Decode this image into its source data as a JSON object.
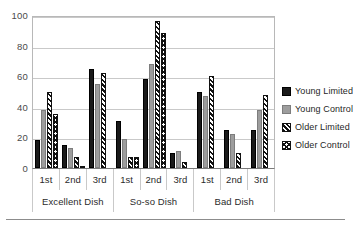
{
  "chart_data": {
    "type": "bar",
    "title": "",
    "subtitle": "",
    "xlabel": "",
    "ylabel": "",
    "ylim": [
      0,
      100
    ],
    "yticks": [
      0,
      20,
      40,
      60,
      80,
      100
    ],
    "grid": true,
    "legend_position": "right",
    "categories": [
      "1st",
      "2nd",
      "3rd",
      "1st",
      "2nd",
      "3rd",
      "1st",
      "2nd",
      "3rd"
    ],
    "group_labels": [
      "Excellent Dish",
      "So-so Dish",
      "Bad Dish"
    ],
    "series": [
      {
        "name": "Young Limited",
        "color": "#1a1a1a",
        "pattern": "solid-black",
        "values": [
          18,
          15,
          65,
          31,
          58,
          10,
          50,
          25,
          25
        ]
      },
      {
        "name": "Young Control",
        "color": "#9d9d9d",
        "pattern": "solid-gray",
        "values": [
          38,
          13,
          55,
          19,
          68,
          11,
          47,
          22,
          38
        ]
      },
      {
        "name": "Older Limited",
        "color": "#111111",
        "pattern": "diagonal-hatch",
        "values": [
          50,
          7,
          62,
          7,
          96,
          4,
          60,
          10,
          48
        ]
      },
      {
        "name": "Older Control",
        "color": "#111111",
        "pattern": "cross-hatch",
        "values": [
          35,
          1,
          0,
          7,
          88,
          0,
          0,
          0,
          0
        ]
      }
    ]
  },
  "legend": {
    "items": [
      {
        "label": "Young Limited",
        "swatch": "legend-swatch-young-limited"
      },
      {
        "label": "Young Control",
        "swatch": "legend-swatch-young-control"
      },
      {
        "label": "Older Limited",
        "swatch": "legend-swatch-older-limited"
      },
      {
        "label": "Older Control",
        "swatch": "legend-swatch-older-control"
      }
    ]
  }
}
